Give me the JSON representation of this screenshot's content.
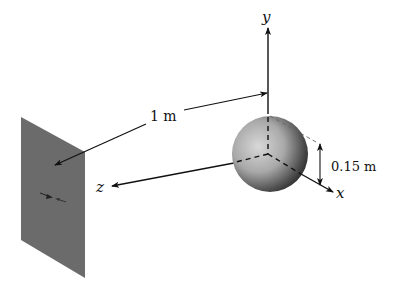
{
  "diagram": {
    "type": "physics-geometry",
    "labels": {
      "y_axis": "y",
      "x_axis": "x",
      "z_axis": "z",
      "distance": "1 m",
      "radius": "0.15 m"
    },
    "objects": {
      "plate": {
        "shape": "parallelogram",
        "color": "#6b6b6b"
      },
      "sphere": {
        "shape": "sphere",
        "radius_label": "0.15 m"
      },
      "axes": [
        "x",
        "y",
        "z"
      ]
    },
    "colors": {
      "plate": "#6b6b6b",
      "lines": "#111111",
      "background": "#ffffff"
    }
  }
}
